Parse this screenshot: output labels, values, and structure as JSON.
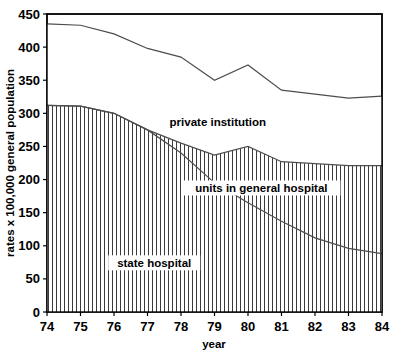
{
  "chart_data": {
    "type": "area",
    "title": "",
    "subtitle": "",
    "xlabel": "year",
    "ylabel": "rates x 100,000 general population",
    "xlim": [
      74,
      84
    ],
    "ylim": [
      0,
      450
    ],
    "x": [
      74,
      75,
      76,
      77,
      78,
      79,
      80,
      81,
      82,
      83,
      84
    ],
    "xticks": [
      "74",
      "75",
      "76",
      "77",
      "78",
      "79",
      "80",
      "81",
      "82",
      "83",
      "84"
    ],
    "yticks": [
      "0",
      "50",
      "100",
      "150",
      "200",
      "250",
      "300",
      "350",
      "400",
      "450"
    ],
    "grid": false,
    "legend_position": "inline-annotations",
    "stacked": true,
    "series": [
      {
        "name": "state hospital",
        "values": [
          312,
          311,
          300,
          275,
          240,
          195,
          165,
          137,
          112,
          96,
          88
        ]
      },
      {
        "name": "units in general hospital",
        "values": [
          0,
          0,
          0,
          0,
          15,
          42,
          85,
          90,
          112,
          125,
          133
        ]
      },
      {
        "name": "private institution",
        "values": [
          123,
          122,
          120,
          123,
          130,
          113,
          123,
          108,
          105,
          102,
          105
        ]
      }
    ],
    "cumulative_boundaries": {
      "state_hospital_top": [
        312,
        311,
        300,
        275,
        240,
        195,
        165,
        137,
        112,
        96,
        88
      ],
      "units_top": [
        312,
        311,
        300,
        275,
        255,
        237,
        250,
        227,
        224,
        221,
        221
      ],
      "total_top": [
        435,
        433,
        420,
        398,
        385,
        350,
        373,
        335,
        329,
        323,
        326
      ]
    },
    "annotations": [
      {
        "name": "private institution",
        "text": "private institution",
        "x": 79.1,
        "y": 285
      },
      {
        "name": "units in general hospital",
        "text": "units in general hospital",
        "x": 80.4,
        "y": 185
      },
      {
        "name": "state hospital",
        "text": "state hospital",
        "x": 77.2,
        "y": 72
      }
    ],
    "colors": {
      "line": "#4d4d4d",
      "axis": "#000000",
      "hatch": "#3b3b3b",
      "background": "#ffffff",
      "text": "#000000"
    }
  }
}
